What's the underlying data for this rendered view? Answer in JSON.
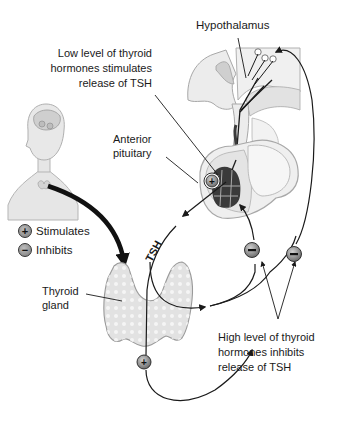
{
  "labels": {
    "hypothalamus": "Hypothalamus",
    "low_level_line1": "Low level of thyroid",
    "low_level_line2": "hormones stimulates",
    "low_level_line3": "release of TSH",
    "anterior_pituitary_line1": "Anterior",
    "anterior_pituitary_line2": "pituitary",
    "tsh": "TSH",
    "thyroid_gland_line1": "Thyroid",
    "thyroid_gland_line2": "gland",
    "high_level_line1": "High level of thyroid",
    "high_level_line2": "hormones inhibits",
    "high_level_line3": "release of TSH"
  },
  "legend": {
    "items": [
      {
        "symbol": "+",
        "label": "Stimulates"
      },
      {
        "symbol": "−",
        "label": "Inhibits"
      }
    ]
  },
  "markers": {
    "pituitary_stimulate": "+",
    "thyroid_stimulate": "+",
    "inhibit_pituitary": "−",
    "inhibit_hypothalamus": "−"
  },
  "colors": {
    "line": "#1a1a1a",
    "tissue_fill": "#eeeeee",
    "tissue_stroke": "#9a9a9a",
    "dark_tissue": "#3a3a3a",
    "marker_fill": "#9a9a9a",
    "body_fill": "#e8e8e8"
  }
}
